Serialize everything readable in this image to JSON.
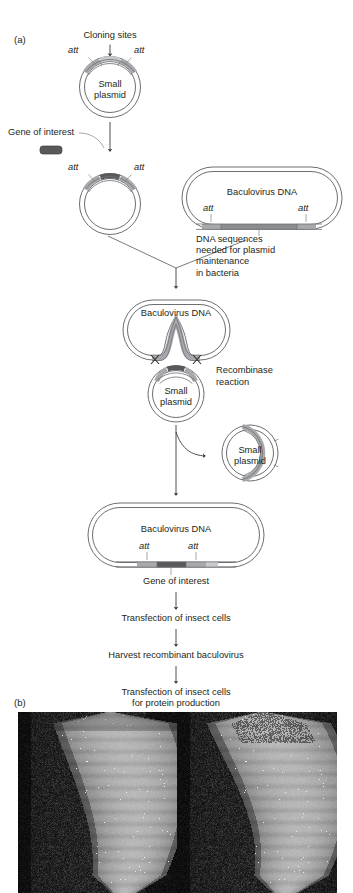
{
  "figure": {
    "panel_a_label": "(a)",
    "panel_b_label": "(b)"
  },
  "panel_a": {
    "steps": [
      {
        "id": "donor-plasmid",
        "title": "Small plasmid",
        "title_line1": "Small",
        "title_line2": "plasmid",
        "callout": "Cloning sites",
        "att_left": "att",
        "att_right": "att"
      },
      {
        "id": "gene-insert",
        "gene_label": "Gene of interest",
        "att_left": "att",
        "att_right": "att"
      },
      {
        "id": "baculovirus-donor",
        "title": "Baculovirus DNA",
        "att_left": "att",
        "att_right": "att",
        "annotation": "DNA sequences\nneeded for plasmid\nmaintenance\nin bacteria"
      },
      {
        "id": "cointegrate",
        "bacmid_title": "Baculovirus DNA",
        "plasmid_line1": "Small",
        "plasmid_line2": "plasmid",
        "reaction_line1": "Recombinase",
        "reaction_line2": "reaction"
      },
      {
        "id": "released-plasmid",
        "line1": "Small",
        "line2": "plasmid"
      },
      {
        "id": "recombinant-bacmid",
        "title": "Baculovirus DNA",
        "att_left": "att",
        "att_right": "att",
        "gene_label": "Gene of interest"
      }
    ],
    "flow_steps": [
      "Transfection of insect cells",
      "Harvest recombinant baculovirus",
      "Transfection of insect cells\nfor protein production"
    ]
  },
  "panel_b": {
    "images": [
      {
        "id": "larva-left",
        "alt": "Insect larva on dark substrate"
      },
      {
        "id": "larva-right",
        "alt": "Insect larva on dark substrate"
      }
    ]
  },
  "colors": {
    "text": "#231f20",
    "line": "#58585a",
    "att_segment": "#a7a9ac",
    "gene_segment": "#58595b",
    "cloning_site": "#c8c9cb",
    "backbone_fill": "#f1f1f2",
    "photo_bg": "#101010"
  }
}
